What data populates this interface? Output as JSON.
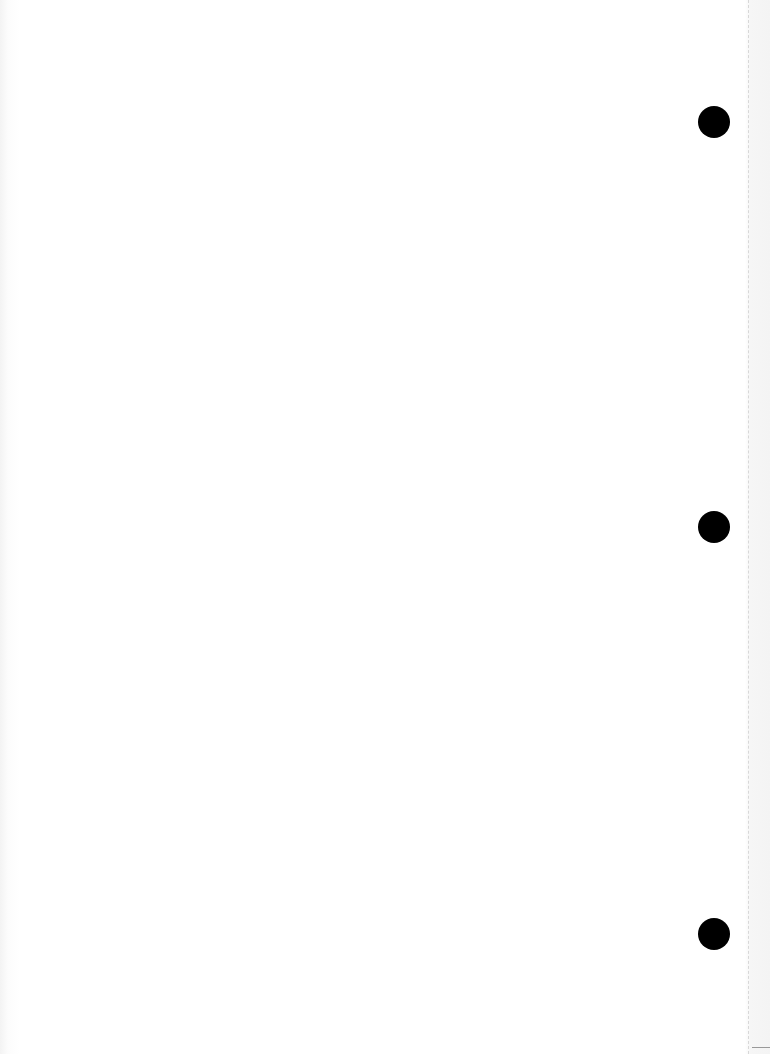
{
  "document": {
    "type": "blank-scanned-page",
    "text": "",
    "binder_holes": [
      {
        "cx": 714,
        "cy": 122
      },
      {
        "cx": 714,
        "cy": 527
      },
      {
        "cx": 714,
        "cy": 934
      }
    ],
    "colors": {
      "paper": "#ffffff",
      "hole": "#000000",
      "edge": "#d8d8d8"
    }
  }
}
